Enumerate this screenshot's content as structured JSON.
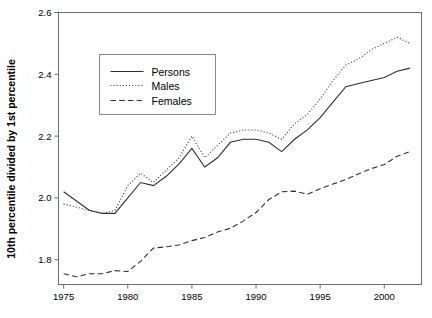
{
  "chart_data": {
    "type": "line",
    "title": "",
    "xlabel": "",
    "ylabel": "10th percentile divided by 1st percentile",
    "xlim": [
      1974.6,
      2002.9
    ],
    "ylim": [
      1.72,
      2.6
    ],
    "grid": false,
    "legend_position": "top-left-inside",
    "xticks": [
      1975,
      1980,
      1985,
      1990,
      1995,
      2000
    ],
    "xtick_labels": [
      "1975",
      "1980",
      "1985",
      "1990",
      "1995",
      "2000"
    ],
    "yticks": [
      1.8,
      2.0,
      2.2,
      2.4,
      2.6
    ],
    "ytick_labels": [
      "1.8",
      "2.0",
      "2.2",
      "2.4",
      "2.6"
    ],
    "x": [
      1975,
      1976,
      1977,
      1978,
      1979,
      1980,
      1981,
      1982,
      1983,
      1984,
      1985,
      1986,
      1987,
      1988,
      1989,
      1990,
      1991,
      1992,
      1993,
      1994,
      1995,
      1996,
      1997,
      1998,
      1999,
      2000,
      2001,
      2002
    ],
    "series": [
      {
        "name": "Persons",
        "style": "solid",
        "values": [
          2.02,
          1.99,
          1.96,
          1.95,
          1.95,
          2.0,
          2.05,
          2.04,
          2.07,
          2.11,
          2.16,
          2.1,
          2.13,
          2.18,
          2.19,
          2.19,
          2.18,
          2.15,
          2.19,
          2.22,
          2.26,
          2.31,
          2.36,
          2.37,
          2.38,
          2.39,
          2.41,
          2.42
        ]
      },
      {
        "name": "Males",
        "style": "dotted",
        "values": [
          1.98,
          1.97,
          1.96,
          1.95,
          1.96,
          2.04,
          2.08,
          2.05,
          2.09,
          2.13,
          2.2,
          2.13,
          2.17,
          2.21,
          2.22,
          2.22,
          2.21,
          2.19,
          2.24,
          2.27,
          2.32,
          2.38,
          2.43,
          2.45,
          2.48,
          2.5,
          2.52,
          2.5
        ]
      },
      {
        "name": "Females",
        "style": "dashed",
        "values": [
          1.755,
          1.745,
          1.755,
          1.755,
          1.765,
          1.762,
          1.795,
          1.838,
          1.842,
          1.848,
          1.862,
          1.872,
          1.89,
          1.902,
          1.925,
          1.953,
          1.995,
          2.02,
          2.022,
          2.012,
          2.03,
          2.045,
          2.06,
          2.078,
          2.095,
          2.108,
          2.135,
          2.15
        ]
      }
    ]
  },
  "legend": {
    "entries": [
      {
        "label": "Persons"
      },
      {
        "label": "Males"
      },
      {
        "label": "Females"
      }
    ]
  }
}
